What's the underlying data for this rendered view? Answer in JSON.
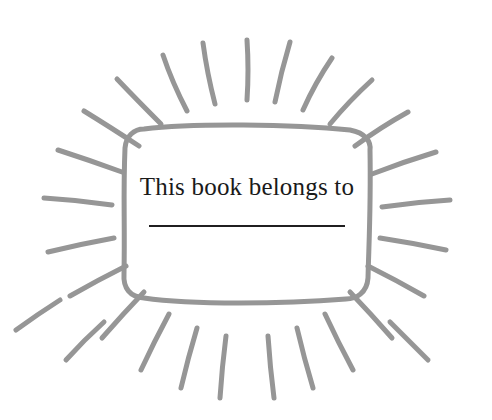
{
  "page": {
    "background_color": "#ffffff",
    "width": 492,
    "height": 420
  },
  "plate": {
    "caption": "This book belongs to",
    "signature_line_label": "",
    "frame_color": "#969696",
    "frame_stroke_width": 5,
    "text_color": "#1a1a1a",
    "line_color": "#201f20",
    "box": {
      "x": 122,
      "y": 126,
      "width": 250,
      "height": 174,
      "corner_radius": 22
    }
  },
  "sunburst": {
    "ray_color": "#969696",
    "ray_stroke_width": 5,
    "ray_count": 28,
    "center": {
      "x": 247,
      "y": 212
    },
    "rays": [
      {
        "x1": 247,
        "y1": 100,
        "x2": 247,
        "y2": 40,
        "cx": 249,
        "cy": 70
      },
      {
        "x1": 275,
        "y1": 102,
        "x2": 290,
        "y2": 42,
        "cx": 281,
        "cy": 72
      },
      {
        "x1": 215,
        "y1": 104,
        "x2": 203,
        "y2": 43,
        "cx": 207,
        "cy": 73
      },
      {
        "x1": 303,
        "y1": 110,
        "x2": 332,
        "y2": 58,
        "cx": 315,
        "cy": 83
      },
      {
        "x1": 187,
        "y1": 111,
        "x2": 163,
        "y2": 55,
        "cx": 172,
        "cy": 82
      },
      {
        "x1": 330,
        "y1": 124,
        "x2": 372,
        "y2": 80,
        "cx": 349,
        "cy": 101
      },
      {
        "x1": 161,
        "y1": 124,
        "x2": 117,
        "y2": 79,
        "cx": 137,
        "cy": 100
      },
      {
        "x1": 355,
        "y1": 146,
        "x2": 408,
        "y2": 112,
        "cx": 381,
        "cy": 127
      },
      {
        "x1": 139,
        "y1": 146,
        "x2": 84,
        "y2": 111,
        "cx": 110,
        "cy": 127
      },
      {
        "x1": 372,
        "y1": 174,
        "x2": 436,
        "y2": 152,
        "cx": 403,
        "cy": 162
      },
      {
        "x1": 122,
        "y1": 172,
        "x2": 58,
        "y2": 150,
        "cx": 89,
        "cy": 160
      },
      {
        "x1": 382,
        "y1": 207,
        "x2": 450,
        "y2": 200,
        "cx": 416,
        "cy": 202
      },
      {
        "x1": 112,
        "y1": 205,
        "x2": 44,
        "y2": 198,
        "cx": 78,
        "cy": 200
      },
      {
        "x1": 380,
        "y1": 238,
        "x2": 446,
        "y2": 250,
        "cx": 413,
        "cy": 243
      },
      {
        "x1": 114,
        "y1": 238,
        "x2": 48,
        "y2": 252,
        "cx": 81,
        "cy": 244
      },
      {
        "x1": 368,
        "y1": 266,
        "x2": 424,
        "y2": 296,
        "cx": 396,
        "cy": 280
      },
      {
        "x1": 126,
        "y1": 266,
        "x2": 70,
        "y2": 296,
        "cx": 98,
        "cy": 280
      },
      {
        "x1": 350,
        "y1": 292,
        "x2": 392,
        "y2": 338,
        "cx": 371,
        "cy": 314
      },
      {
        "x1": 144,
        "y1": 292,
        "x2": 102,
        "y2": 338,
        "cx": 123,
        "cy": 314
      },
      {
        "x1": 325,
        "y1": 314,
        "x2": 353,
        "y2": 370,
        "cx": 338,
        "cy": 342
      },
      {
        "x1": 169,
        "y1": 314,
        "x2": 141,
        "y2": 370,
        "cx": 154,
        "cy": 342
      },
      {
        "x1": 297,
        "y1": 328,
        "x2": 313,
        "y2": 388,
        "cx": 304,
        "cy": 358
      },
      {
        "x1": 197,
        "y1": 328,
        "x2": 181,
        "y2": 388,
        "cx": 188,
        "cy": 358
      },
      {
        "x1": 268,
        "y1": 336,
        "x2": 274,
        "y2": 398,
        "cx": 270,
        "cy": 367
      },
      {
        "x1": 226,
        "y1": 336,
        "x2": 220,
        "y2": 398,
        "cx": 222,
        "cy": 367
      },
      {
        "x1": 390,
        "y1": 322,
        "x2": 428,
        "y2": 360,
        "cx": 408,
        "cy": 340
      },
      {
        "x1": 104,
        "y1": 322,
        "x2": 66,
        "y2": 360,
        "cx": 84,
        "cy": 340
      },
      {
        "x1": 60,
        "y1": 300,
        "x2": 16,
        "y2": 330,
        "cx": 38,
        "cy": 314
      }
    ]
  }
}
